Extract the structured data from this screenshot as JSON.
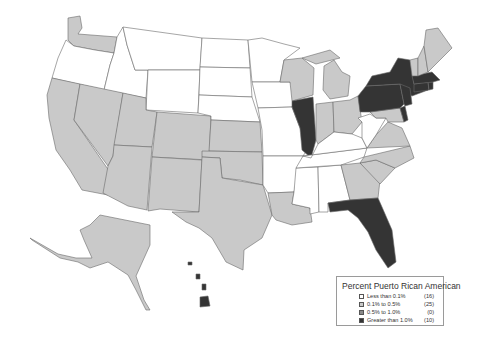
{
  "legend": {
    "title": "Percent Puerto Rican American",
    "items": [
      {
        "label": "Less than 0.1%",
        "count": "(16)",
        "color": "#ffffff"
      },
      {
        "label": "0.1% to 0.5%",
        "count": "(25)",
        "color": "#c9c9c9"
      },
      {
        "label": "0.5% to 1.0%",
        "count": "(0)",
        "color": "#8a8a8a"
      },
      {
        "label": "Greater than 1.0%",
        "count": "(10)",
        "color": "#343434"
      }
    ]
  },
  "map": {
    "subject": "United States by state, percent Puerto Rican American",
    "classes": {
      "less_than_0_1": [
        "Oregon",
        "Idaho",
        "Montana",
        "Wyoming",
        "North Dakota",
        "South Dakota",
        "Nebraska",
        "Minnesota",
        "Iowa",
        "Missouri",
        "Arkansas",
        "Mississippi",
        "Alabama",
        "Tennessee",
        "Kentucky",
        "West Virginia"
      ],
      "0_1_to_0_5": [
        "Washington",
        "California",
        "Nevada",
        "Utah",
        "Arizona",
        "Colorado",
        "New Mexico",
        "Kansas",
        "Oklahoma",
        "Texas",
        "Louisiana",
        "Wisconsin",
        "Michigan",
        "Indiana",
        "Ohio",
        "Georgia",
        "South Carolina",
        "North Carolina",
        "Virginia",
        "Maryland",
        "Vermont",
        "New Hampshire",
        "Maine",
        "Alaska",
        "District of Columbia"
      ],
      "0_5_to_1_0": [],
      "greater_than_1_0": [
        "Illinois",
        "Florida",
        "New York",
        "Pennsylvania",
        "New Jersey",
        "Connecticut",
        "Massachusetts",
        "Rhode Island",
        "Delaware",
        "Hawaii"
      ]
    }
  }
}
